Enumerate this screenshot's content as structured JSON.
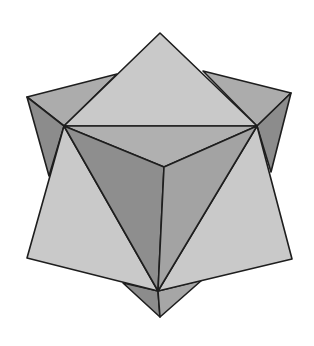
{
  "figure": {
    "title": "Compound of cube and octahedron",
    "colors": {
      "background": "#ffffff",
      "light_face": "#c9c9c9",
      "mid_face": "#a6a6a6",
      "dark_face": "#8c8c8c",
      "edge": "#1e1e1e"
    },
    "vertices": {
      "top_apex": [
        160,
        33
      ],
      "bottom_apex": [
        160,
        317
      ],
      "outer_top_left": [
        27,
        97
      ],
      "outer_top_right": [
        291,
        93
      ],
      "outer_bottom_left": [
        27,
        258
      ],
      "outer_bottom_right": [
        292,
        259
      ],
      "inner_left": [
        64,
        126
      ],
      "inner_right": [
        257,
        126
      ],
      "inner_bottom": [
        158,
        291
      ],
      "center": [
        164,
        167
      ]
    }
  }
}
